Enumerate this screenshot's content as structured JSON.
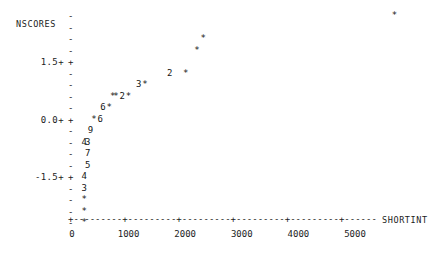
{
  "chart_data": {
    "type": "scatter",
    "title": "",
    "subtitle": "",
    "xlabel": "SHORTINT",
    "ylabel": "NSCORES",
    "xlim": [
      0,
      5700
    ],
    "ylim": [
      -2.25,
      2.25
    ],
    "grid": false,
    "legend": null,
    "style": "character-cell-plot",
    "x_ticks": [
      {
        "label": "0",
        "value": 0
      },
      {
        "label": "1000",
        "value": 1000
      },
      {
        "label": "2000",
        "value": 2000
      },
      {
        "label": "3000",
        "value": 3000
      },
      {
        "label": "4000",
        "value": 4000
      },
      {
        "label": "5000",
        "value": 5000
      }
    ],
    "y_ticks": [
      {
        "label": "",
        "value": 2.25,
        "mark": "-"
      },
      {
        "label": "",
        "value": 2.0,
        "mark": "-"
      },
      {
        "label": "",
        "value": 1.875,
        "mark": "-"
      },
      {
        "label": "",
        "value": 1.75,
        "mark": "-"
      },
      {
        "label": "1.5+",
        "value": 1.5,
        "mark": "+"
      },
      {
        "label": "",
        "value": 1.25,
        "mark": "-"
      },
      {
        "label": "",
        "value": 1.0,
        "mark": "-"
      },
      {
        "label": "",
        "value": 0.75,
        "mark": "-"
      },
      {
        "label": "",
        "value": 0.5,
        "mark": "-"
      },
      {
        "label": "0.0+",
        "value": 0.0,
        "mark": "+"
      },
      {
        "label": "",
        "value": -0.25,
        "mark": "-"
      },
      {
        "label": "",
        "value": -0.5,
        "mark": "-"
      },
      {
        "label": "",
        "value": -0.75,
        "mark": "-"
      },
      {
        "label": "",
        "value": -1.0,
        "mark": "-"
      },
      {
        "label": "-1.5+",
        "value": -1.5,
        "mark": "+"
      },
      {
        "label": "",
        "value": -1.625,
        "mark": "-"
      },
      {
        "label": "",
        "value": -1.75,
        "mark": "-"
      },
      {
        "label": "",
        "value": -1.875,
        "mark": "-"
      },
      {
        "label": "",
        "value": -2.1,
        "mark": "-"
      }
    ],
    "cells": [
      {
        "row": 0,
        "char": "*",
        "x": 5650,
        "count": 1
      },
      {
        "row": 2,
        "char": "*",
        "x": 2270,
        "count": 1
      },
      {
        "row": 3,
        "char": "*",
        "x": 2160,
        "count": 1
      },
      {
        "row": 5,
        "char": "2",
        "x": 1680,
        "count": 2
      },
      {
        "row": 5,
        "char": "*",
        "x": 1960,
        "count": 1
      },
      {
        "row": 6,
        "char": "3",
        "x": 1130,
        "count": 3
      },
      {
        "row": 6,
        "char": "*",
        "x": 1240,
        "count": 1
      },
      {
        "row": 7,
        "char": "*",
        "x": 670,
        "count": 1
      },
      {
        "row": 7,
        "char": "*",
        "x": 730,
        "count": 1
      },
      {
        "row": 7,
        "char": "2",
        "x": 840,
        "count": 2
      },
      {
        "row": 7,
        "char": "*",
        "x": 950,
        "count": 1
      },
      {
        "row": 8,
        "char": "6",
        "x": 500,
        "count": 6
      },
      {
        "row": 8,
        "char": "*",
        "x": 610,
        "count": 1
      },
      {
        "row": 9,
        "char": "*",
        "x": 340,
        "count": 1
      },
      {
        "row": 9,
        "char": "6",
        "x": 450,
        "count": 6
      },
      {
        "row": 10,
        "char": "9",
        "x": 280,
        "count": 9
      },
      {
        "row": 11,
        "char": "4",
        "x": 170,
        "count": 4
      },
      {
        "row": 11,
        "char": "3",
        "x": 230,
        "count": 3
      },
      {
        "row": 12,
        "char": "7",
        "x": 230,
        "count": 7
      },
      {
        "row": 13,
        "char": "5",
        "x": 230,
        "count": 5
      },
      {
        "row": 14,
        "char": "4",
        "x": 170,
        "count": 4
      },
      {
        "row": 15,
        "char": "3",
        "x": 170,
        "count": 3
      },
      {
        "row": 16,
        "char": "*",
        "x": 170,
        "count": 1
      },
      {
        "row": 17,
        "char": "*",
        "x": 170,
        "count": 1
      },
      {
        "row": 18,
        "char": "*",
        "x": 170,
        "count": 1
      }
    ],
    "axis_line_chars": "+---------+---------+---------+---------+---------+------"
  },
  "layout": {
    "tick_column_x": 68,
    "first_row_y": 11,
    "row_height": 11.5,
    "plot_origin_x": 72,
    "x_scale_px_per_unit": 0.0566
  }
}
